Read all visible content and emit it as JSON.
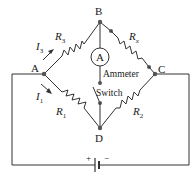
{
  "diagram": {
    "type": "wheatstone-bridge",
    "nodes": {
      "A": "A",
      "B": "B",
      "C": "C",
      "D": "D"
    },
    "resistors": {
      "r3": {
        "name": "R",
        "sub": "3"
      },
      "rx": {
        "name": "R",
        "sub": "x"
      },
      "r1": {
        "name": "R",
        "sub": "1"
      },
      "r2": {
        "name": "R",
        "sub": "2"
      }
    },
    "currents": {
      "i3": {
        "name": "I",
        "sub": "3"
      },
      "i1": {
        "name": "I",
        "sub": "1"
      }
    },
    "ammeter": {
      "symbol": "A",
      "label": "Ammeter"
    },
    "switch": {
      "label": "Switch"
    },
    "battery": {
      "plus": "+",
      "minus": "−"
    },
    "colors": {
      "wire": "#333333",
      "node": "#555555",
      "text": "#1a1a1a"
    }
  }
}
